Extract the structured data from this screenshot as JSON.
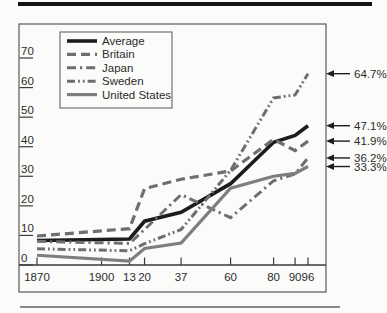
{
  "figure": {
    "kind": "scanned-textbook-line-chart"
  },
  "colors": {
    "paper": "#fbfbfa",
    "black_line": "#1c1c1c",
    "gray_line": "#6e6e6e",
    "us_gray_line": "#7e7e7e",
    "box_border": "#5a5a5a",
    "axis": "#3a3a3a",
    "text": "#2b2b2b",
    "arrow": "#1e1e1e",
    "top_rule": "#141414",
    "bottom_rule": "#8a8a8a"
  },
  "chart_data": {
    "type": "line",
    "title": "",
    "xlabel": "",
    "ylabel": "",
    "grid": false,
    "legend_position": "top-left",
    "xlim": [
      1870,
      1996
    ],
    "ylim": [
      0,
      70
    ],
    "y_ticks": [
      "0",
      "10",
      "20",
      "30",
      "40",
      "50",
      "60",
      "70"
    ],
    "y_tick_values": [
      0,
      10,
      20,
      30,
      40,
      50,
      60,
      70
    ],
    "x_tick_labels": [
      "1870",
      "1900",
      "13",
      "20",
      "37",
      "60",
      "80",
      "90",
      "96"
    ],
    "x_tick_years": [
      1870,
      1900,
      1913,
      1920,
      1937,
      1960,
      1980,
      1990,
      1996
    ],
    "x": [
      1870,
      1913,
      1920,
      1937,
      1960,
      1980,
      1990,
      1996
    ],
    "series": [
      {
        "name": "Average",
        "values": [
          8.3,
          8.8,
          14.8,
          17.8,
          27.5,
          41.5,
          43.8,
          47.1
        ],
        "end_label": "47.1%",
        "color": "#1c1c1c",
        "dash": "solid",
        "width": 3.6
      },
      {
        "name": "Britain",
        "values": [
          9.8,
          12.3,
          25.8,
          29.0,
          31.8,
          42.5,
          38.7,
          41.9
        ],
        "end_label": "41.9%",
        "color": "#6e6e6e",
        "dash": "dashed",
        "width": 3.2
      },
      {
        "name": "Japan",
        "values": [
          8.0,
          7.3,
          12.0,
          23.8,
          16.0,
          28.5,
          30.8,
          36.2
        ],
        "end_label": "36.2%",
        "color": "#6e6e6e",
        "dash": "dash-dot",
        "width": 3.0
      },
      {
        "name": "Sweden",
        "values": [
          5.5,
          4.8,
          7.2,
          12.0,
          32.0,
          56.5,
          57.5,
          64.7
        ],
        "end_label": "64.7%",
        "color": "#6e6e6e",
        "dash": "dash-dot-dot",
        "width": 3.0
      },
      {
        "name": "United States",
        "values": [
          3.3,
          1.3,
          5.6,
          7.4,
          26.0,
          30.0,
          31.0,
          33.3
        ],
        "end_label": "33.3%",
        "color": "#7e7e7e",
        "dash": "solid",
        "width": 3.2
      }
    ]
  }
}
